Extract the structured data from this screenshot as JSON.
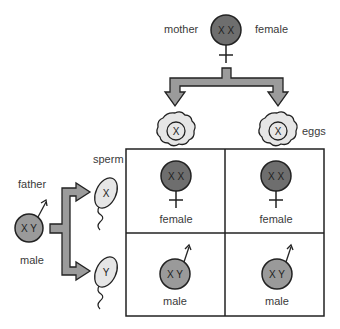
{
  "colors": {
    "female_fill": "#6e6e6e",
    "male_fill": "#9a9a9a",
    "gamete_fill": "#e6e6e6",
    "arrow_fill": "#9b9b9b",
    "stroke": "#222222"
  },
  "mother": {
    "label": "mother",
    "sex": "female",
    "chromosomes": "X X"
  },
  "father": {
    "label": "father",
    "sex": "male",
    "chromosomes": "X Y"
  },
  "eggs": {
    "label": "eggs",
    "items": [
      {
        "chromosome": "X"
      },
      {
        "chromosome": "X"
      }
    ]
  },
  "sperm": {
    "label": "sperm",
    "items": [
      {
        "chromosome": "X"
      },
      {
        "chromosome": "Y"
      }
    ]
  },
  "grid": {
    "rows": [
      [
        {
          "chromosomes": "X X",
          "sex": "female"
        },
        {
          "chromosomes": "X X",
          "sex": "female"
        }
      ],
      [
        {
          "chromosomes": "X Y",
          "sex": "male"
        },
        {
          "chromosomes": "X Y",
          "sex": "male"
        }
      ]
    ]
  }
}
